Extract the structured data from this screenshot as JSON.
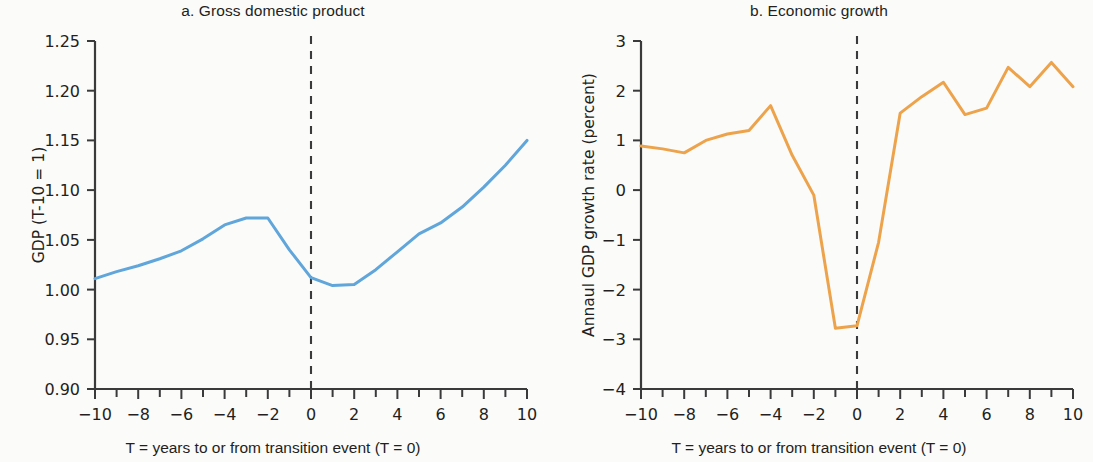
{
  "figure": {
    "background": "#fbfbfa",
    "axis_color": "#3a3a3a",
    "text_color": "#231f20"
  },
  "panel_a": {
    "title": "a. Gross domestic product",
    "ylabel": "GDP  (T-10 = 1)",
    "xlabel": "T = years to or from transition event (T = 0)",
    "line_color": "#60a6da",
    "ytick_labels": [
      "1.25",
      "1.20",
      "1.15",
      "1.10",
      "1.05",
      "1.00",
      "0.95",
      "0.90"
    ],
    "xtick_labels": [
      "−10",
      "−8",
      "−6",
      "−4",
      "−2",
      "0",
      "2",
      "4",
      "6",
      "8",
      "10"
    ],
    "event_line_label": "T = 0"
  },
  "panel_b": {
    "title": "b. Economic growth",
    "ylabel": "Annaul GDP growth rate (percent)",
    "xlabel": "T = years to or from transition event (T = 0)",
    "line_color": "#eda34b",
    "ytick_labels": [
      "3",
      "2",
      "1",
      "0",
      "−1",
      "−2",
      "−3",
      "−4"
    ],
    "xtick_labels": [
      "−10",
      "−8",
      "−6",
      "−4",
      "−2",
      "0",
      "2",
      "4",
      "6",
      "8",
      "10"
    ],
    "event_line_label": "T = 0"
  },
  "chart_data": [
    {
      "type": "line",
      "title": "a. Gross domestic product",
      "xlabel": "T = years to or from transition event (T = 0)",
      "ylabel": "GDP  (T-10 = 1)",
      "xlim": [
        -10,
        10
      ],
      "ylim": [
        0.9,
        1.25
      ],
      "yticks": [
        0.9,
        0.95,
        1.0,
        1.05,
        1.1,
        1.15,
        1.2,
        1.25
      ],
      "xticks": [
        -10,
        -8,
        -6,
        -4,
        -2,
        0,
        2,
        4,
        6,
        8,
        10
      ],
      "xtick_minor_step": 1,
      "grid": false,
      "legend": false,
      "annotations": [
        {
          "type": "vline",
          "x": 0,
          "style": "dashed",
          "color": "#3a3a3a"
        }
      ],
      "series": [
        {
          "name": "GDP index (T-10 = 1)",
          "color": "#60a6da",
          "x": [
            -10,
            -9,
            -8,
            -7,
            -6,
            -5,
            -4,
            -3,
            -2,
            -1,
            0,
            1,
            2,
            3,
            4,
            5,
            6,
            7,
            8,
            9,
            10
          ],
          "values": [
            1.011,
            1.018,
            1.024,
            1.031,
            1.039,
            1.051,
            1.065,
            1.072,
            1.072,
            1.04,
            1.012,
            1.004,
            1.005,
            1.02,
            1.038,
            1.056,
            1.067,
            1.083,
            1.103,
            1.125,
            1.15,
            1.175,
            1.204
          ]
        }
      ]
    },
    {
      "type": "line",
      "title": "b. Economic growth",
      "xlabel": "T = years to or from transition event (T = 0)",
      "ylabel": "Annaul GDP growth rate (percent)",
      "xlim": [
        -10,
        10
      ],
      "ylim": [
        -4,
        3
      ],
      "yticks": [
        -4,
        -3,
        -2,
        -1,
        0,
        1,
        2,
        3
      ],
      "xticks": [
        -10,
        -8,
        -6,
        -4,
        -2,
        0,
        2,
        4,
        6,
        8,
        10
      ],
      "xtick_minor_step": 1,
      "grid": false,
      "legend": false,
      "annotations": [
        {
          "type": "vline",
          "x": 0,
          "style": "dashed",
          "color": "#3a3a3a"
        }
      ],
      "series": [
        {
          "name": "Annual GDP growth rate (percent)",
          "color": "#eda34b",
          "x": [
            -10,
            -9,
            -8,
            -7,
            -6,
            -5,
            -4,
            -3,
            -2,
            -1,
            0,
            1,
            2,
            3,
            4,
            5,
            6,
            7,
            8,
            9,
            10
          ],
          "values": [
            0.89,
            0.83,
            0.75,
            1.0,
            1.13,
            1.2,
            1.7,
            0.7,
            -0.1,
            -2.78,
            -2.73,
            -1.05,
            1.55,
            1.88,
            2.17,
            1.52,
            1.65,
            2.47,
            2.08,
            2.57,
            2.08
          ]
        }
      ]
    }
  ]
}
